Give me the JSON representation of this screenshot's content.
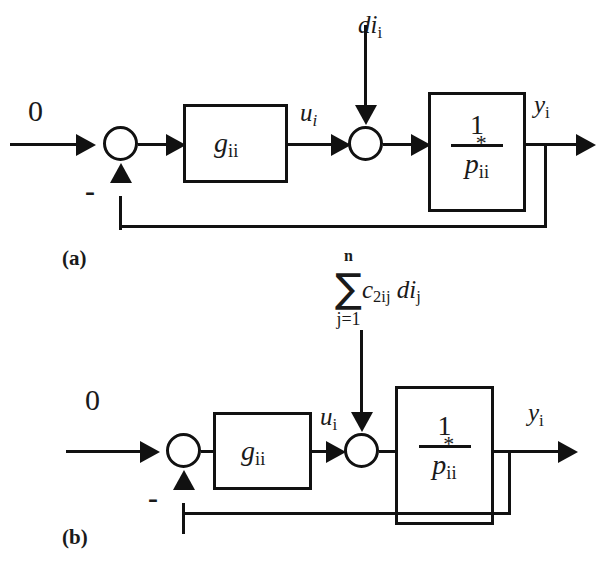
{
  "figure": {
    "background_color": "#ffffff",
    "line_color": "#111111",
    "width": 612,
    "height": 572
  },
  "diagram_a": {
    "caption": "(a)",
    "reference_input": "0",
    "feedback_sign": "-",
    "controller_block": {
      "label_base": "g",
      "label_sub": "ii"
    },
    "plant_block": {
      "numerator": "1",
      "denominator_base": "p",
      "denominator_superscript": "*",
      "denominator_sub": "ii"
    },
    "control_signal": {
      "base": "u",
      "sub": "i"
    },
    "disturbance": {
      "base": "di",
      "sub": "i"
    },
    "output_signal": {
      "base": "y",
      "sub": "i"
    },
    "summing_junction_1": "circle-empty",
    "summing_junction_2": "circle-empty"
  },
  "diagram_b": {
    "caption": "(b)",
    "reference_input": "0",
    "feedback_sign": "-",
    "controller_block": {
      "label_base": "g",
      "label_sub": "ii"
    },
    "plant_block": {
      "numerator": "1",
      "denominator_base": "p",
      "denominator_superscript": "*",
      "denominator_sub": "ii"
    },
    "control_signal": {
      "base": "u",
      "sub": "i"
    },
    "disturbance_sum": {
      "sigma": "∑",
      "upper_limit": "n",
      "lower_limit": "j=1",
      "coefficient_base": "c",
      "coefficient_sub": "2ij",
      "term_base": "di",
      "term_sub": "j"
    },
    "output_signal": {
      "base": "y",
      "sub": "i"
    },
    "summing_junction_1": "circle-empty",
    "summing_junction_2": "circle-empty"
  }
}
